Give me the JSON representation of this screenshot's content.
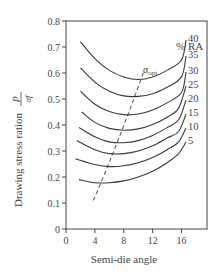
{
  "chart_data": {
    "type": "line",
    "title": "",
    "xlabel": "Semi-die angle",
    "ylabel": "Drawing stress ration",
    "ylabel_fraction": {
      "numerator": "p",
      "denominator": "σ̄f"
    },
    "xlim": [
      0,
      19.5
    ],
    "ylim": [
      0,
      0.8
    ],
    "xticks": [
      0,
      4,
      8,
      12,
      16
    ],
    "yticks": [
      0,
      0.1,
      0.2,
      0.3,
      0.4,
      0.5,
      0.6,
      0.7,
      0.8
    ],
    "grid": false,
    "legend_title": "% RA",
    "legend_position": "right, curve end labels",
    "series": [
      {
        "name": "40",
        "x": [
          2,
          4,
          6,
          8,
          10,
          12,
          14,
          16
        ],
        "y": [
          0.72,
          0.655,
          0.61,
          0.585,
          0.575,
          0.585,
          0.61,
          0.65
        ]
      },
      {
        "name": "35",
        "x": [
          2,
          4,
          6,
          8,
          10,
          12,
          14,
          16
        ],
        "y": [
          0.62,
          0.565,
          0.53,
          0.512,
          0.51,
          0.52,
          0.545,
          0.585
        ]
      },
      {
        "name": "30",
        "x": [
          2,
          4,
          6,
          8,
          10,
          12,
          14,
          16
        ],
        "y": [
          0.53,
          0.48,
          0.452,
          0.44,
          0.442,
          0.458,
          0.485,
          0.525
        ]
      },
      {
        "name": "25",
        "x": [
          2.2,
          4,
          6,
          8,
          10,
          12,
          14,
          15.6
        ],
        "y": [
          0.45,
          0.41,
          0.387,
          0.38,
          0.385,
          0.402,
          0.43,
          0.465
        ]
      },
      {
        "name": "20",
        "x": [
          1.8,
          4,
          6,
          8,
          10,
          12,
          14,
          15.6
        ],
        "y": [
          0.39,
          0.355,
          0.335,
          0.332,
          0.34,
          0.36,
          0.39,
          0.42
        ]
      },
      {
        "name": "15",
        "x": [
          1.5,
          4,
          6,
          8,
          10,
          12,
          14,
          15.6
        ],
        "y": [
          0.34,
          0.305,
          0.29,
          0.29,
          0.3,
          0.32,
          0.35,
          0.375
        ]
      },
      {
        "name": "10",
        "x": [
          1.3,
          4,
          6,
          8,
          10,
          12,
          14,
          15.6
        ],
        "y": [
          0.27,
          0.248,
          0.24,
          0.243,
          0.255,
          0.275,
          0.305,
          0.335
        ]
      },
      {
        "name": "5",
        "x": [
          1.8,
          4,
          6,
          8,
          10,
          12,
          14,
          15.6
        ],
        "y": [
          0.19,
          0.178,
          0.178,
          0.185,
          0.2,
          0.222,
          0.255,
          0.29
        ]
      }
    ],
    "annotations": [
      {
        "text": "α_opt",
        "type": "dashed line",
        "x": [
          3.8,
          10.7
        ],
        "y": [
          0.11,
          0.6
        ]
      }
    ]
  },
  "labels": {
    "ra_title": "% RA",
    "alpha_main": "α",
    "alpha_sub": "opt",
    "ylabel_text": "Drawing stress ration",
    "ylabel_num": "p",
    "ylabel_den": "σ̄f",
    "xlabel_text": "Semi-die angle"
  }
}
